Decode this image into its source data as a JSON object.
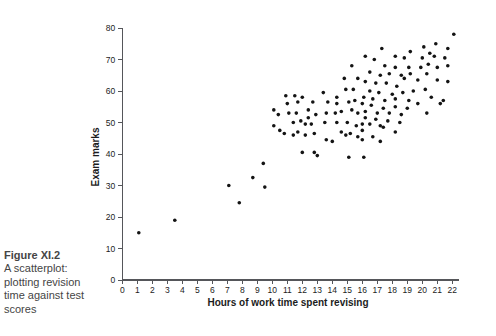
{
  "figure": {
    "caption": {
      "title": "Figure XI.2",
      "lines": [
        "A scatterplot:",
        "plotting revision",
        "time against test",
        "scores"
      ]
    }
  },
  "chart_data": {
    "type": "scatter",
    "title": "",
    "xlabel": "Hours of work time spent revising",
    "ylabel": "Exam marks",
    "xlim": [
      0,
      22
    ],
    "ylim": [
      0,
      80
    ],
    "xticks": [
      0,
      1,
      2,
      3,
      4,
      5,
      6,
      7,
      8,
      9,
      10,
      11,
      12,
      13,
      14,
      15,
      16,
      17,
      18,
      19,
      20,
      21,
      22
    ],
    "yticks": [
      0,
      10,
      20,
      30,
      40,
      50,
      60,
      70,
      80
    ],
    "grid": false,
    "legend": null,
    "axis_color": "#55565a",
    "tick_text_color": "#1c1c1c",
    "marker": {
      "shape": "circle",
      "color": "#141414",
      "radius": 1.8
    },
    "points": [
      [
        1.1,
        15
      ],
      [
        3.5,
        19
      ],
      [
        7.1,
        30
      ],
      [
        7.8,
        24.5
      ],
      [
        8.7,
        32.5
      ],
      [
        9.5,
        29.5
      ],
      [
        9.4,
        37
      ],
      [
        10.1,
        49
      ],
      [
        10.1,
        54
      ],
      [
        10.4,
        52.5
      ],
      [
        10.5,
        47.5
      ],
      [
        10.8,
        46.5
      ],
      [
        10.9,
        58.5
      ],
      [
        11,
        56
      ],
      [
        11.1,
        53
      ],
      [
        11.4,
        50
      ],
      [
        11.4,
        46
      ],
      [
        11.5,
        58.5
      ],
      [
        11.6,
        53
      ],
      [
        11.7,
        47
      ],
      [
        11.7,
        56.5
      ],
      [
        11.9,
        50.5
      ],
      [
        12,
        58
      ],
      [
        12,
        40.5
      ],
      [
        12.2,
        49.5
      ],
      [
        12.2,
        46
      ],
      [
        12.4,
        54
      ],
      [
        12.4,
        51.5
      ],
      [
        12.6,
        49.5
      ],
      [
        12.7,
        56.5
      ],
      [
        12.8,
        46.5
      ],
      [
        12.8,
        40.5
      ],
      [
        12.9,
        52.5
      ],
      [
        13,
        39.5
      ],
      [
        13.4,
        59.5
      ],
      [
        13.5,
        50
      ],
      [
        13.6,
        53
      ],
      [
        13.6,
        44.5
      ],
      [
        13.7,
        56.5
      ],
      [
        14,
        44
      ],
      [
        14.2,
        53
      ],
      [
        14.3,
        50
      ],
      [
        14.3,
        58
      ],
      [
        14.3,
        56
      ],
      [
        14.6,
        47
      ],
      [
        14.6,
        53.5
      ],
      [
        14.8,
        64
      ],
      [
        14.9,
        46
      ],
      [
        14.9,
        60.5
      ],
      [
        15,
        50
      ],
      [
        15.1,
        56.5
      ],
      [
        15.1,
        39
      ],
      [
        15.2,
        46.5
      ],
      [
        15.3,
        68
      ],
      [
        15.3,
        54
      ],
      [
        15.4,
        60.5
      ],
      [
        15.5,
        57
      ],
      [
        15.6,
        49
      ],
      [
        15.7,
        64
      ],
      [
        15.7,
        45.5
      ],
      [
        15.7,
        53
      ],
      [
        16,
        56
      ],
      [
        16,
        49.5
      ],
      [
        16,
        47.5
      ],
      [
        16,
        44.5
      ],
      [
        16.1,
        58
      ],
      [
        16.1,
        39
      ],
      [
        16.2,
        71
      ],
      [
        16.2,
        63
      ],
      [
        16.2,
        53.5
      ],
      [
        16.2,
        51.5
      ],
      [
        16.5,
        66
      ],
      [
        16.5,
        60
      ],
      [
        16.5,
        49.5
      ],
      [
        16.6,
        55.5
      ],
      [
        16.7,
        57.5
      ],
      [
        16.7,
        45.5
      ],
      [
        16.8,
        70
      ],
      [
        16.9,
        62.5
      ],
      [
        16.9,
        51
      ],
      [
        17,
        53
      ],
      [
        17.1,
        59.5
      ],
      [
        17.2,
        65
      ],
      [
        17.2,
        49
      ],
      [
        17.2,
        44
      ],
      [
        17.3,
        73.5
      ],
      [
        17.4,
        54.5
      ],
      [
        17.4,
        48.5
      ],
      [
        17.5,
        68
      ],
      [
        17.5,
        57
      ],
      [
        17.6,
        62.5
      ],
      [
        17.7,
        50.5
      ],
      [
        17.8,
        65.5
      ],
      [
        17.8,
        53
      ],
      [
        18,
        59
      ],
      [
        18.2,
        71
      ],
      [
        18.2,
        67.5
      ],
      [
        18.2,
        57.5
      ],
      [
        18.2,
        55
      ],
      [
        18.2,
        47
      ],
      [
        18.3,
        61.5
      ],
      [
        18.5,
        50
      ],
      [
        18.6,
        65
      ],
      [
        18.6,
        52.5
      ],
      [
        18.7,
        59.5
      ],
      [
        18.8,
        70.5
      ],
      [
        18.8,
        64
      ],
      [
        19,
        54.5
      ],
      [
        19.1,
        67.5
      ],
      [
        19.1,
        57
      ],
      [
        19.2,
        72.5
      ],
      [
        19.2,
        65.5
      ],
      [
        19.4,
        60
      ],
      [
        19.7,
        63.5
      ],
      [
        19.7,
        56
      ],
      [
        19.9,
        67.5
      ],
      [
        20,
        70.5
      ],
      [
        20.1,
        74
      ],
      [
        20.2,
        60.5
      ],
      [
        20.3,
        65.5
      ],
      [
        20.3,
        53
      ],
      [
        20.4,
        68.5
      ],
      [
        20.5,
        72
      ],
      [
        20.6,
        58
      ],
      [
        20.8,
        71
      ],
      [
        20.9,
        75
      ],
      [
        21,
        67.5
      ],
      [
        21,
        63.5
      ],
      [
        21.2,
        56
      ],
      [
        21.4,
        57
      ],
      [
        21.5,
        70.5
      ],
      [
        21.7,
        73.5
      ],
      [
        21.7,
        68
      ],
      [
        21.7,
        63
      ],
      [
        22.1,
        78
      ]
    ],
    "layout": {
      "origin_px": [
        122.3,
        280
      ],
      "px_per_hour": 15.0,
      "px_per_mark": 3.15,
      "x_axis_overhang_px": 7,
      "tick_len_px": 4
    }
  }
}
